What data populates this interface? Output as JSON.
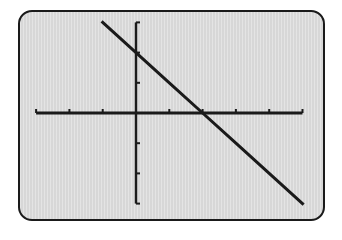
{
  "chart_data": {
    "type": "line",
    "title": "",
    "xlabel": "",
    "ylabel": "",
    "xlim": [
      -3,
      5
    ],
    "ylim": [
      -3,
      3
    ],
    "xscale_ticks": 1,
    "yscale_ticks": 1,
    "grid": false,
    "legend": null,
    "series": [
      {
        "name": "y = -x + 2",
        "x": [
          -1,
          0,
          1,
          2,
          3,
          4,
          5
        ],
        "y": [
          3,
          2,
          1,
          0,
          -1,
          -2,
          -3
        ]
      }
    ],
    "y_intercept": 2,
    "x_intercept": 2
  },
  "colors": {
    "screen_background": "#dedede",
    "ink": "#1a1a1a",
    "page_background": "#ffffff"
  },
  "screen": {
    "description": "Graphing calculator display window"
  }
}
